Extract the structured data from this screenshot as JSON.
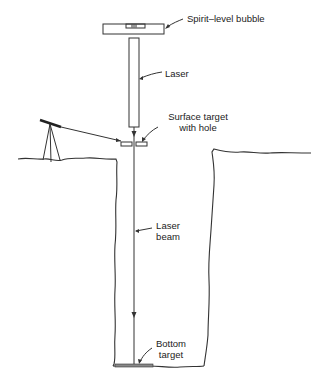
{
  "diagram": {
    "labels": {
      "spirit_level": "Spirit–level bubble",
      "laser": "Laser",
      "surface_target_line1": "Surface target",
      "surface_target_line2": "with hole",
      "laser_beam_line1": "Laser",
      "laser_beam_line2": "beam",
      "bottom_target_line1": "Bottom",
      "bottom_target_line2": "target"
    },
    "components": [
      "spirit-level-plate",
      "laser",
      "surface-target",
      "tripod-instrument",
      "ground-surface",
      "shaft",
      "laser-beam",
      "bottom-target"
    ],
    "colors": {
      "line": "#333333",
      "background": "#ffffff"
    }
  }
}
